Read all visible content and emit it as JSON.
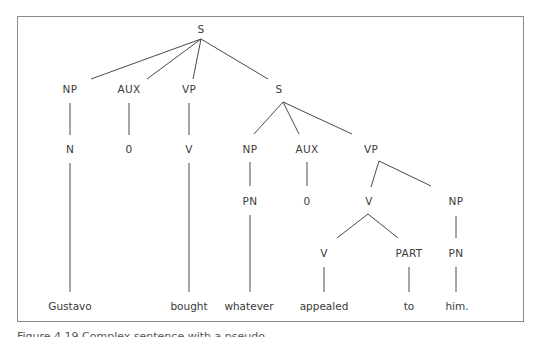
{
  "diagram": {
    "type": "syntax-tree",
    "sentence": "Gustavo bought whatever appealed to him.",
    "colors": {
      "frame": "#8a8a8a",
      "lines": "#4a4a4a",
      "text": "#3a3a3a"
    },
    "nodes": {
      "root_s": "S",
      "np1": "NP",
      "aux1": "AUX",
      "vp1": "VP",
      "s2": "S",
      "n1": "N",
      "zero1": "0",
      "v1": "V",
      "np2": "NP",
      "aux2": "AUX",
      "vp2": "VP",
      "pn1": "PN",
      "zero2": "0",
      "v2": "V",
      "np3": "NP",
      "v3": "V",
      "part": "PART",
      "pn2": "PN"
    },
    "words": {
      "w1": "Gustavo",
      "w2": "bought",
      "w3": "whatever",
      "w4": "appealed",
      "w5": "to",
      "w6": "him."
    },
    "edges": [
      [
        "S",
        "NP"
      ],
      [
        "S",
        "AUX"
      ],
      [
        "S",
        "VP"
      ],
      [
        "S",
        "S"
      ],
      [
        "NP",
        "N"
      ],
      [
        "AUX",
        "0"
      ],
      [
        "VP",
        "V"
      ],
      [
        "S",
        "NP"
      ],
      [
        "S",
        "AUX"
      ],
      [
        "S",
        "VP"
      ],
      [
        "NP",
        "PN"
      ],
      [
        "AUX",
        "0"
      ],
      [
        "VP",
        "V"
      ],
      [
        "VP",
        "NP"
      ],
      [
        "V",
        "V"
      ],
      [
        "V",
        "PART"
      ],
      [
        "NP",
        "PN"
      ]
    ]
  },
  "caption": {
    "text": "Figure 4.19 Complex sentence with a pseudo-..."
  }
}
